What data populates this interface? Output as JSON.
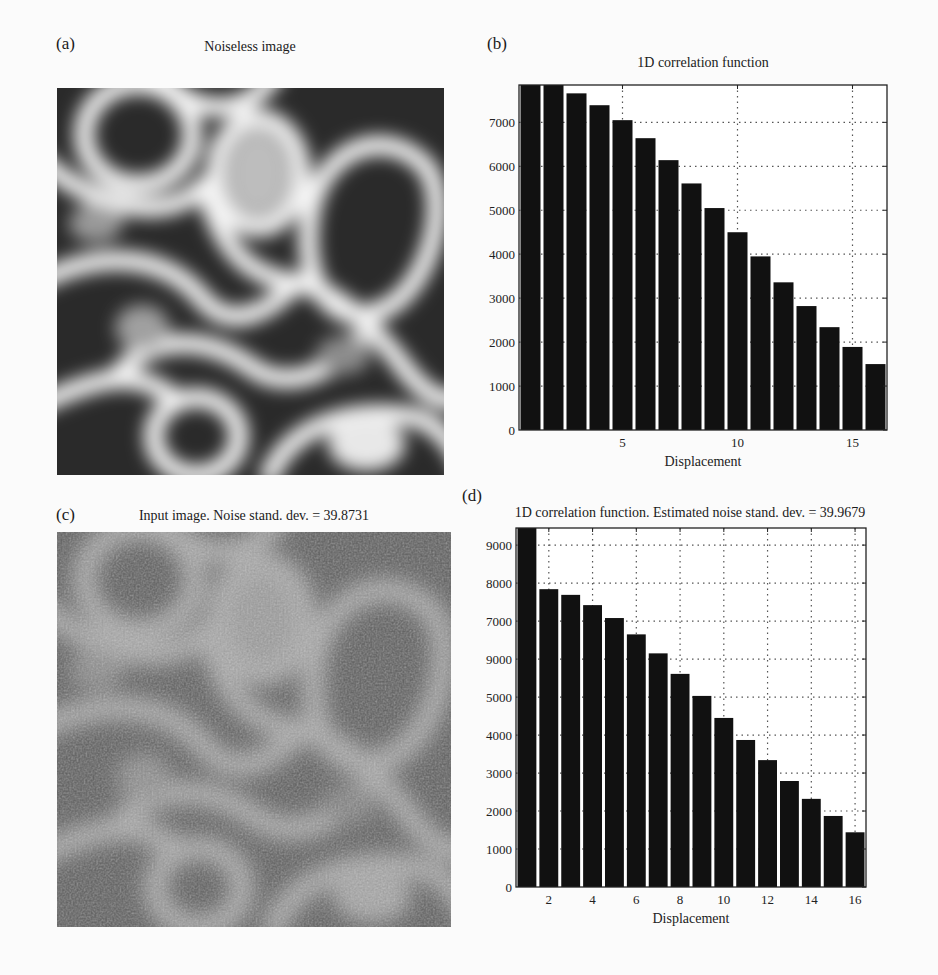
{
  "panels": {
    "a": {
      "label": "(a)",
      "title": "Noiseless image"
    },
    "b": {
      "label": "(b)",
      "title": "1D correlation function"
    },
    "c": {
      "label": "(c)",
      "title": "Input image. Noise stand. dev. = 39.8731"
    },
    "d": {
      "label": "(d)",
      "title": "1D correlation function. Estimated noise stand. dev. = 39.9679"
    }
  },
  "chart_data": [
    {
      "id": "b",
      "type": "bar",
      "title": "1D correlation function",
      "xlabel": "Displacement",
      "ylabel": "",
      "categories": [
        1,
        2,
        3,
        4,
        5,
        6,
        7,
        8,
        9,
        10,
        11,
        12,
        13,
        14,
        15,
        16
      ],
      "values": [
        7900,
        7850,
        7660,
        7390,
        7050,
        6640,
        6140,
        5610,
        5050,
        4500,
        3950,
        3360,
        2820,
        2340,
        1890,
        1500
      ],
      "clipped": [
        true,
        true,
        false,
        false,
        false,
        false,
        false,
        false,
        false,
        false,
        false,
        false,
        false,
        false,
        false,
        false
      ],
      "ylim": [
        0,
        7850
      ],
      "xlim": [
        0.5,
        16.5
      ],
      "yticks": [
        "0",
        "1000",
        "2000",
        "3000",
        "4000",
        "5000",
        "6000",
        "7000"
      ],
      "ytick_values": [
        0,
        1000,
        2000,
        3000,
        4000,
        5000,
        6000,
        7000
      ],
      "xticks": [
        "5",
        "10",
        "15"
      ],
      "xtick_values": [
        5,
        10,
        15
      ],
      "grid": true,
      "grid_style": "dotted",
      "bar_color": "#111111"
    },
    {
      "id": "d",
      "type": "bar",
      "title": "1D correlation function. Estimated noise stand. dev. = 39.9679",
      "xlabel": "Displacement",
      "ylabel": "",
      "categories": [
        1,
        2,
        3,
        4,
        5,
        6,
        7,
        8,
        9,
        10,
        11,
        12,
        13,
        14,
        15,
        16
      ],
      "values": [
        9450,
        7840,
        7690,
        7420,
        7080,
        6650,
        6150,
        5610,
        5030,
        4450,
        3870,
        3340,
        2790,
        2320,
        1870,
        1440
      ],
      "clipped": [
        true,
        false,
        false,
        false,
        false,
        false,
        false,
        false,
        false,
        false,
        false,
        false,
        false,
        false,
        false,
        false
      ],
      "ylim": [
        0,
        9450
      ],
      "xlim": [
        0.5,
        16.5
      ],
      "yticks": [
        "0",
        "1000",
        "2000",
        "3000",
        "4000",
        "5000",
        "9000",
        "7000",
        "8000",
        "9000"
      ],
      "ytick_values": [
        0,
        1000,
        2000,
        3000,
        4000,
        5000,
        6000,
        7000,
        8000,
        9000
      ],
      "xticks": [
        "2",
        "4",
        "6",
        "8",
        "10",
        "12",
        "14",
        "16"
      ],
      "xtick_values": [
        2,
        4,
        6,
        8,
        10,
        12,
        14,
        16
      ],
      "grid": true,
      "grid_style": "dotted",
      "bar_color": "#111111"
    }
  ]
}
